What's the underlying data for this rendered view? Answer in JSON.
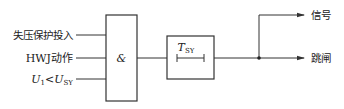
{
  "diagram": {
    "type": "logic-block-diagram",
    "inputs": [
      {
        "label": "失压保护投入"
      },
      {
        "label": "HWJ动作"
      },
      {
        "label_main": "U",
        "label_sub": "1",
        "label_op": "<",
        "label_main2": "U",
        "label_sub2": "SY"
      }
    ],
    "and_gate": {
      "label": "&"
    },
    "timer": {
      "label_main": "T",
      "label_sub": "SY"
    },
    "outputs": [
      {
        "label": "信号"
      },
      {
        "label": "跳闸"
      }
    ],
    "colors": {
      "line": "#333333",
      "text": "#222222",
      "background": "#ffffff"
    }
  }
}
